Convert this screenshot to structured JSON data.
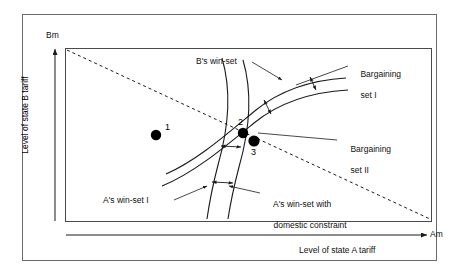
{
  "figure": {
    "type": "diagram",
    "background": "#ffffff",
    "line_color": "#1a1a1a",
    "point_color": "#000000"
  },
  "axes": {
    "y_axis_tip_label": "Bm",
    "y_axis_title": "Level of state B tariff",
    "x_axis_tip_label": "Am",
    "x_axis_title": "Level of state A tariff"
  },
  "annotations": [
    {
      "id": "b-win-set",
      "text": "B's win-set"
    },
    {
      "id": "bargaining-set-1",
      "line1": "Bargaining",
      "line2": "set I"
    },
    {
      "id": "bargaining-set-2",
      "line1": "Bargaining",
      "line2": "set II"
    },
    {
      "id": "a-win-set-1",
      "text": "A's win-set I"
    },
    {
      "id": "a-win-set-dom",
      "line1": "A's win-set with",
      "line2": "domestic constraint"
    }
  ],
  "labels": {
    "b_win_set": "B's win-set",
    "bargaining_set_1_line1": "Bargaining",
    "bargaining_set_1_line2": "set I",
    "bargaining_set_2_line1": "Bargaining",
    "bargaining_set_2_line2": "set II",
    "a_win_set_1": "A's win-set I",
    "a_win_set_dom_line1": "A's win-set with",
    "a_win_set_dom_line2": "domestic constraint"
  },
  "points": [
    {
      "label": "1",
      "x": 156,
      "y": 135
    },
    {
      "label": "2",
      "x": 243,
      "y": 133
    },
    {
      "label": "3",
      "x": 254,
      "y": 141
    }
  ],
  "point_labels": {
    "p1": "1",
    "p2": "2",
    "p3": "3"
  }
}
